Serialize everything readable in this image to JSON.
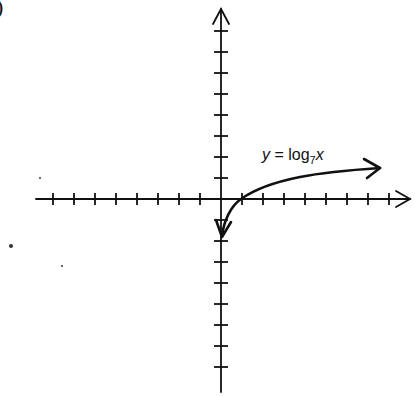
{
  "panel": {
    "label": ")"
  },
  "equation": {
    "lhs": "y",
    "eq": " = ",
    "fn": "log",
    "base": "7",
    "arg": "x"
  },
  "colors": {
    "ink": "#111111",
    "background": "#ffffff"
  },
  "chart_data": {
    "type": "line",
    "title": "",
    "function": "y = log_7(x)",
    "xlabel": "",
    "ylabel": "",
    "grid": false,
    "legend": null,
    "annotations": [
      "y = log7 x"
    ],
    "axes": {
      "origin_px": [
        221,
        199
      ],
      "tick_spacing_px": 21,
      "x_ticks": [
        -8,
        -7,
        -6,
        -5,
        -4,
        -3,
        -2,
        -1,
        1,
        2,
        3,
        4,
        5,
        6,
        7,
        8
      ],
      "y_ticks": [
        -8,
        -7,
        -6,
        -5,
        -4,
        -3,
        -2,
        -1,
        1,
        2,
        3,
        4,
        5,
        6,
        7,
        8
      ],
      "xlim": [
        -8.7,
        9
      ],
      "ylim": [
        -9,
        9
      ],
      "x_arrow": "positive",
      "y_arrow": "positive"
    },
    "x": [
      0.143,
      0.3,
      0.5,
      1,
      2,
      3,
      5,
      7
    ],
    "values": [
      -1,
      -0.62,
      -0.36,
      0,
      0.36,
      0.56,
      0.83,
      1
    ],
    "curve_arrows": [
      "down-near-y-axis",
      "right"
    ],
    "key_points": [
      {
        "x": 1,
        "y": 0
      },
      {
        "x": 7,
        "y": 1
      }
    ]
  }
}
